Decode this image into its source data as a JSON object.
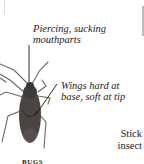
{
  "annotations": {
    "mouthparts": "Piercing, sucking\nmouthparts",
    "mouthparts_line1": "Piercing, sucking",
    "mouthparts_line2": "mouthparts",
    "wings_line1": "Wings hard at",
    "wings_line2": "base, soft at tip"
  },
  "side_label": {
    "line1": "Stick",
    "line2": "insect"
  },
  "caption": "BUGS",
  "colors": {
    "bug_body": "#4a4542",
    "leader_line": "#1a1a1a",
    "text": "#222222"
  }
}
